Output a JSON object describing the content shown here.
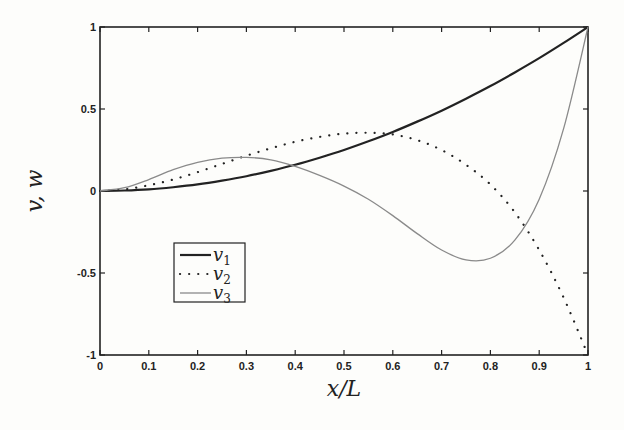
{
  "chart_data": {
    "type": "line",
    "title": "",
    "xlabel": "x/L",
    "ylabel": "v, w",
    "xlim": [
      0,
      1
    ],
    "ylim": [
      -1,
      1
    ],
    "grid": false,
    "legend_position": "inside-left-lower",
    "xticks": [
      0,
      0.1,
      0.2,
      0.3,
      0.4,
      0.5,
      0.6,
      0.7,
      0.8,
      0.9,
      1
    ],
    "xtick_labels": [
      "0",
      "0.1",
      "0.2",
      "0.3",
      "0.4",
      "0.5",
      "0.6",
      "0.7",
      "0.8",
      "0.9",
      "1"
    ],
    "yticks": [
      -1,
      -0.5,
      0,
      0.5,
      1
    ],
    "ytick_labels": [
      "-1",
      "-0.5",
      "0",
      "0.5",
      "1"
    ],
    "x": [
      0,
      0.05,
      0.1,
      0.15,
      0.2,
      0.25,
      0.3,
      0.35,
      0.4,
      0.45,
      0.5,
      0.55,
      0.6,
      0.65,
      0.7,
      0.75,
      0.8,
      0.85,
      0.9,
      0.95,
      1
    ],
    "series": [
      {
        "name": "v1",
        "label_base": "v",
        "label_sub": "1",
        "style": "solid-thick",
        "color": "#222222",
        "values": [
          0,
          0.003,
          0.01,
          0.023,
          0.04,
          0.063,
          0.09,
          0.123,
          0.16,
          0.203,
          0.25,
          0.303,
          0.36,
          0.423,
          0.49,
          0.563,
          0.64,
          0.723,
          0.81,
          0.903,
          1
        ]
      },
      {
        "name": "v2",
        "label_base": "v",
        "label_sub": "2",
        "style": "dotted",
        "color": "#222222",
        "values": [
          0,
          0.01,
          0.035,
          0.07,
          0.115,
          0.165,
          0.215,
          0.26,
          0.3,
          0.33,
          0.35,
          0.355,
          0.345,
          0.31,
          0.25,
          0.16,
          0.04,
          -0.13,
          -0.36,
          -0.65,
          -1
        ]
      },
      {
        "name": "v3",
        "label_base": "v",
        "label_sub": "3",
        "style": "solid-thin",
        "color": "#8a8a8a",
        "values": [
          0,
          0.02,
          0.07,
          0.13,
          0.175,
          0.2,
          0.205,
          0.19,
          0.15,
          0.095,
          0.03,
          -0.05,
          -0.15,
          -0.26,
          -0.36,
          -0.42,
          -0.41,
          -0.3,
          -0.05,
          0.38,
          1
        ]
      }
    ]
  }
}
